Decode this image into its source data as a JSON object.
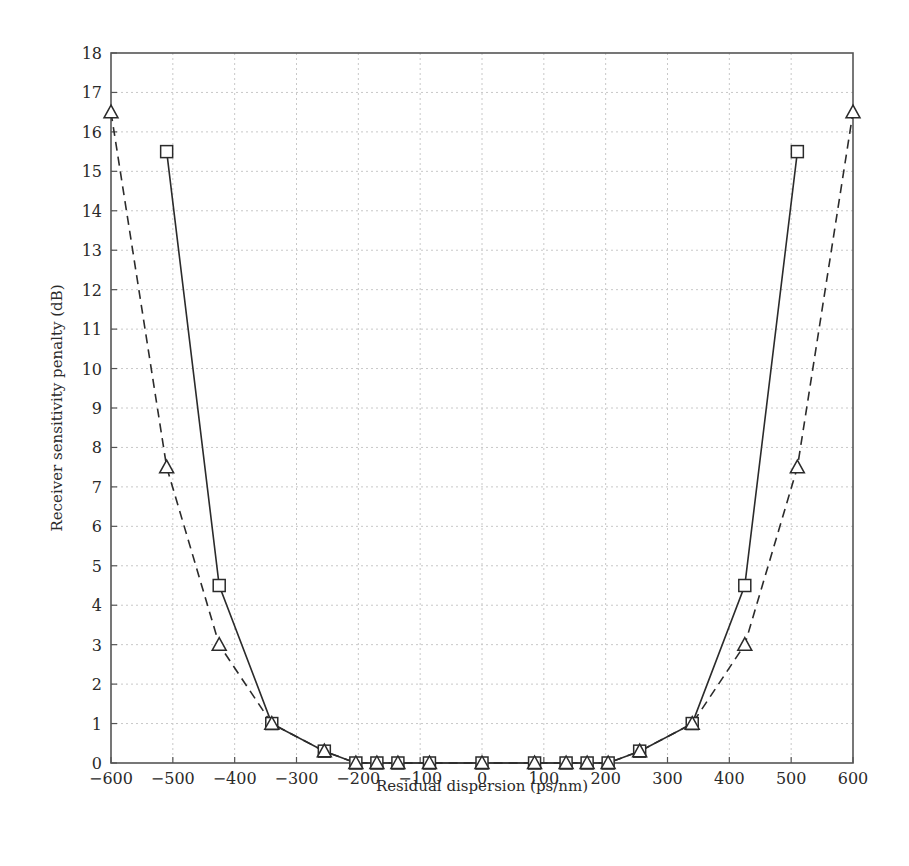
{
  "chart_data": {
    "type": "line",
    "title": "",
    "xlabel": "Residual dispersion (ps/nm)",
    "ylabel": "Receiver sensitivity penalty (dB)",
    "xlim": [
      -600,
      600
    ],
    "ylim": [
      0,
      18
    ],
    "xticks": [
      -600,
      -500,
      -400,
      -300,
      -200,
      -100,
      0,
      100,
      200,
      300,
      400,
      500,
      600
    ],
    "yticks": [
      0,
      1,
      2,
      3,
      4,
      5,
      6,
      7,
      8,
      9,
      10,
      11,
      12,
      13,
      14,
      15,
      16,
      17,
      18
    ],
    "grid": true,
    "legend": null,
    "series": [
      {
        "name": "Series A (solid, square markers)",
        "line_style": "solid",
        "marker": "square",
        "x": [
          -510,
          -425,
          -340,
          -255,
          -204,
          -170,
          -136,
          -85,
          0,
          85,
          136,
          170,
          204,
          255,
          340,
          425,
          510
        ],
        "y": [
          15.5,
          4.5,
          1.0,
          0.3,
          0,
          0,
          0,
          0,
          0,
          0,
          0,
          0,
          0,
          0.3,
          1.0,
          4.5,
          15.5
        ]
      },
      {
        "name": "Series B (dashed, triangle markers)",
        "line_style": "dashed",
        "marker": "triangle",
        "x": [
          -600,
          -510,
          -425,
          -340,
          -255,
          -204,
          -170,
          -136,
          -85,
          0,
          85,
          136,
          170,
          204,
          255,
          340,
          425,
          510,
          600
        ],
        "y": [
          16.5,
          7.5,
          3.0,
          1.0,
          0.3,
          0,
          0,
          0,
          0,
          0,
          0,
          0,
          0,
          0,
          0.3,
          1.0,
          3.0,
          7.5,
          16.5
        ]
      }
    ]
  },
  "style": {
    "line_color": "#2b2b2b",
    "grid_color": "#c8c8c8",
    "frame_color": "#555555",
    "background": "#ffffff"
  }
}
